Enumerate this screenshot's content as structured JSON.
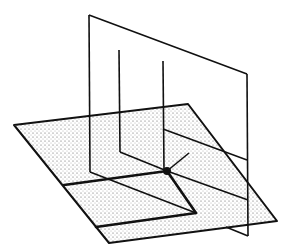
{
  "figure": {
    "description": "Perspective drawing of a vertical plane intersecting a stippled horizontal plane, with perpendicular lines projected onto the horizontal plane meeting at a point",
    "colors": {
      "ink": "#111111",
      "stipple": "#6a6a6a",
      "background": "#ffffff"
    },
    "horizontal_plane": {
      "points": "14,125 188,104 277,221 109,243"
    },
    "vertical_plane": {
      "top_edge": [
        [
          89,
          15
        ],
        [
          247,
          74
        ]
      ],
      "left_edge": [
        [
          89,
          15
        ],
        [
          89,
          172
        ]
      ],
      "right_edge": [
        [
          247,
          74
        ],
        [
          248,
          236
        ]
      ],
      "bottom_edge": [
        [
          226,
          227
        ],
        [
          248,
          236
        ]
      ]
    },
    "vertical_lines": [
      {
        "x1": 89,
        "y1": 15,
        "x2": 90,
        "y2": 172
      },
      {
        "x1": 119,
        "y1": 50,
        "x2": 120,
        "y2": 152
      },
      {
        "x1": 163,
        "y1": 61,
        "x2": 164,
        "y2": 171
      }
    ],
    "center_point": {
      "cx": 167,
      "cy": 171,
      "r": 4
    }
  }
}
